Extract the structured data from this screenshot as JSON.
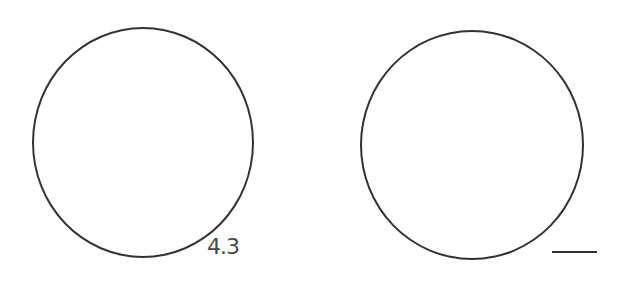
{
  "worksheet": {
    "figures": [
      {
        "shape": "circle",
        "label": "4.3"
      },
      {
        "shape": "circle",
        "label": ""
      }
    ],
    "answer_blank": "",
    "colors": {
      "stroke": "#333333",
      "text": "#4a4a4a",
      "background": "#ffffff"
    }
  }
}
